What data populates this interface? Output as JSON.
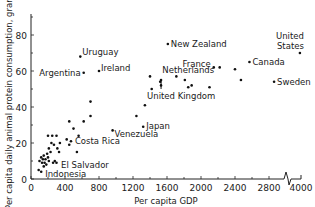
{
  "chart_data": {
    "type": "scatter",
    "title": "",
    "xlabel": "Per capita GDP",
    "ylabel": "Per capita daily animal protein consumption, grams",
    "x_ticks": [
      0,
      400,
      800,
      1200,
      1600,
      2000,
      2400,
      2800,
      4000
    ],
    "x_tick_labels": [
      "0",
      "400",
      "800",
      "1200",
      "1600",
      "2000",
      "2400",
      "2800",
      "4000"
    ],
    "x_axis_break": "between 2800 and 4000",
    "y_ticks": [
      0,
      20,
      40,
      60,
      80
    ],
    "y_tick_labels": [
      "0",
      "20",
      "40",
      "60",
      "80"
    ],
    "xlim": [
      0,
      4000
    ],
    "ylim": [
      0,
      90
    ],
    "grid": false,
    "legend": null,
    "labeled_points": [
      {
        "label": "United States",
        "x": 3900,
        "y": 70
      },
      {
        "label": "New Zealand",
        "x": 1610,
        "y": 75
      },
      {
        "label": "Uruguay",
        "x": 580,
        "y": 68
      },
      {
        "label": "Ireland",
        "x": 800,
        "y": 60
      },
      {
        "label": "Argentina",
        "x": 620,
        "y": 59
      },
      {
        "label": "Canada",
        "x": 2570,
        "y": 65
      },
      {
        "label": "France",
        "x": 2150,
        "y": 62
      },
      {
        "label": "Netherlands",
        "x": 1710,
        "y": 57
      },
      {
        "label": "United Kingdom",
        "x": 1530,
        "y": 52
      },
      {
        "label": "Sweden",
        "x": 2860,
        "y": 54
      },
      {
        "label": "Japan",
        "x": 1320,
        "y": 29
      },
      {
        "label": "Venezuela",
        "x": 960,
        "y": 27
      },
      {
        "label": "Costa Rica",
        "x": 470,
        "y": 21
      },
      {
        "label": "El Salvador",
        "x": 260,
        "y": 9
      },
      {
        "label": "Indonesia",
        "x": 120,
        "y": 4
      }
    ],
    "unlabeled_points": [
      {
        "x": 1240,
        "y": 35
      },
      {
        "x": 1340,
        "y": 41
      },
      {
        "x": 1400,
        "y": 57
      },
      {
        "x": 1420,
        "y": 50
      },
      {
        "x": 1530,
        "y": 55
      },
      {
        "x": 1520,
        "y": 54
      },
      {
        "x": 1850,
        "y": 51
      },
      {
        "x": 1890,
        "y": 52
      },
      {
        "x": 2100,
        "y": 51
      },
      {
        "x": 2220,
        "y": 62
      },
      {
        "x": 2400,
        "y": 61
      },
      {
        "x": 2470,
        "y": 55
      },
      {
        "x": 1810,
        "y": 55
      },
      {
        "x": 700,
        "y": 43
      },
      {
        "x": 700,
        "y": 35
      },
      {
        "x": 620,
        "y": 32
      },
      {
        "x": 450,
        "y": 32
      },
      {
        "x": 500,
        "y": 28
      },
      {
        "x": 560,
        "y": 24
      },
      {
        "x": 420,
        "y": 22
      },
      {
        "x": 450,
        "y": 19
      },
      {
        "x": 540,
        "y": 15
      },
      {
        "x": 200,
        "y": 24
      },
      {
        "x": 250,
        "y": 24
      },
      {
        "x": 300,
        "y": 24
      },
      {
        "x": 240,
        "y": 20
      },
      {
        "x": 270,
        "y": 19
      },
      {
        "x": 340,
        "y": 20
      },
      {
        "x": 210,
        "y": 17
      },
      {
        "x": 310,
        "y": 17
      },
      {
        "x": 230,
        "y": 15
      },
      {
        "x": 330,
        "y": 15
      },
      {
        "x": 190,
        "y": 14
      },
      {
        "x": 150,
        "y": 13
      },
      {
        "x": 200,
        "y": 12
      },
      {
        "x": 120,
        "y": 12
      },
      {
        "x": 170,
        "y": 11
      },
      {
        "x": 140,
        "y": 11
      },
      {
        "x": 100,
        "y": 10
      },
      {
        "x": 210,
        "y": 10
      },
      {
        "x": 160,
        "y": 9
      },
      {
        "x": 130,
        "y": 9
      },
      {
        "x": 180,
        "y": 8
      },
      {
        "x": 150,
        "y": 7
      },
      {
        "x": 280,
        "y": 10
      },
      {
        "x": 300,
        "y": 9
      },
      {
        "x": 90,
        "y": 5
      }
    ]
  },
  "axes": {
    "xlabel": "Per capita GDP",
    "ylabel": "Per capita daily animal protein consumption, grams"
  }
}
